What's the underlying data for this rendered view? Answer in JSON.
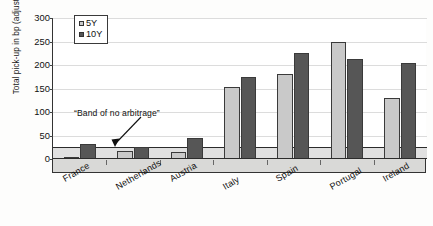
{
  "chart_data": {
    "type": "bar",
    "title": "",
    "subtitle": "",
    "xlabel": "",
    "ylabel": "Total pick-up in bp (adjusted)",
    "ylim": [
      0,
      300
    ],
    "ytick_values": [
      0,
      50,
      100,
      150,
      200,
      250,
      300
    ],
    "ytick_labels": [
      "0",
      "50",
      "100",
      "150",
      "200",
      "250",
      "300"
    ],
    "grid": true,
    "legend_position": "top-left-inside",
    "categories": [
      "France",
      "Netherlands",
      "Austria",
      "Italy",
      "Spain",
      "Portugal",
      "Ireland"
    ],
    "series": [
      {
        "name": "5Y",
        "color": "#c9c9c9",
        "values": [
          5,
          17,
          15,
          153,
          180,
          250,
          130
        ]
      },
      {
        "name": "10Y",
        "color": "#565656",
        "values": [
          32,
          25,
          45,
          175,
          225,
          213,
          205
        ]
      }
    ],
    "annotations": [
      {
        "text": "“Band of no arbitrage”",
        "points_to_value": 25,
        "band_range": [
          0,
          25
        ],
        "band_color": "#d6d6d6"
      }
    ]
  },
  "legend": {
    "items": [
      {
        "label": "5Y",
        "swatch": "light-gray-square"
      },
      {
        "label": "10Y",
        "swatch": "dark-gray-square"
      }
    ]
  },
  "axes": {
    "y_title": "Total pick-up in bp (adjusted)",
    "y_ticks": [
      "300",
      "250",
      "200",
      "150",
      "100",
      "50",
      "0"
    ],
    "x_categories": [
      "France",
      "Netherlands",
      "Austria",
      "Italy",
      "Spain",
      "Portugal",
      "Ireland"
    ]
  },
  "annotation": {
    "label": "“Band of no arbitrage”"
  },
  "colors": {
    "series_5y": "#c9c9c9",
    "series_10y": "#565656",
    "band": "#d6d6d6",
    "axis": "#2b2b2b",
    "grid": "#dcdcdc"
  }
}
